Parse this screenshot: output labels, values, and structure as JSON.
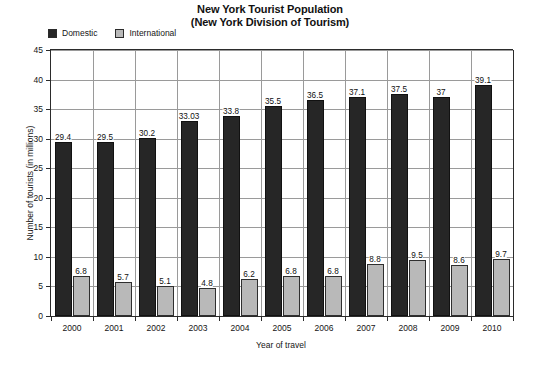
{
  "title": {
    "line1": "New York Tourist Population",
    "line2": "(New York Division of Tourism)"
  },
  "legend": {
    "position": "top-left",
    "entries": [
      {
        "label": "Domestic",
        "color": "#262626"
      },
      {
        "label": "International",
        "color": "#b9b9b9"
      }
    ]
  },
  "axes": {
    "x_title": "Year of travel",
    "y_title": "Number of tourists (in millions)"
  },
  "chart_data": {
    "type": "bar",
    "title": "New York Tourist Population (New York Division of Tourism)",
    "xlabel": "Year of travel",
    "ylabel": "Number of tourists (in millions)",
    "categories": [
      "2000",
      "2001",
      "2002",
      "2003",
      "2004",
      "2005",
      "2006",
      "2007",
      "2008",
      "2009",
      "2010"
    ],
    "series": [
      {
        "name": "Domestic",
        "color": "#262626",
        "values": [
          29.4,
          29.5,
          30.2,
          33.03,
          33.8,
          35.5,
          36.5,
          37.1,
          37.5,
          37,
          39.1
        ],
        "labels": [
          "29.4",
          "29.5",
          "30.2",
          "33.03",
          "33.8",
          "35.5",
          "36.5",
          "37.1",
          "37.5",
          "37",
          "39.1"
        ]
      },
      {
        "name": "International",
        "color": "#b9b9b9",
        "values": [
          6.8,
          5.7,
          5.1,
          4.8,
          6.2,
          6.8,
          6.8,
          8.8,
          9.5,
          8.6,
          9.7
        ],
        "labels": [
          "6.8",
          "5.7",
          "5.1",
          "4.8",
          "6.2",
          "6.8",
          "6.8",
          "8.8",
          "9.5",
          "8.6",
          "9.7"
        ]
      }
    ],
    "ylim": [
      0,
      45
    ],
    "yticks": [
      0,
      5,
      10,
      15,
      20,
      25,
      30,
      35,
      40,
      45
    ],
    "ytick_labels": [
      "0",
      "5",
      "10",
      "15",
      "20",
      "25",
      "30",
      "35",
      "40",
      "45"
    ],
    "grid": "both",
    "legend_position": "top-left"
  }
}
